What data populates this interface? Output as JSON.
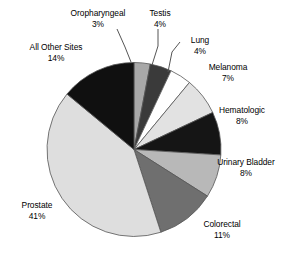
{
  "chart_data": {
    "type": "pie",
    "title": "",
    "subtitle": "",
    "xlabel": "",
    "ylabel": "",
    "legend_position": "none",
    "grid": false,
    "labels_show_percent": true,
    "start_angle_deg": 0,
    "direction": "clockwise",
    "categories": [
      "Oropharyngeal",
      "Testis",
      "Lung",
      "Melanoma",
      "Hematologic",
      "Urinary Bladder",
      "Colorectal",
      "Prostate",
      "All Other Sites"
    ],
    "values": [
      3,
      4,
      4,
      7,
      8,
      8,
      11,
      41,
      14
    ],
    "value_labels": [
      "3%",
      "4%",
      "4%",
      "7%",
      "8%",
      "8%",
      "11%",
      "41%",
      "14%"
    ],
    "colors": [
      "#a8a8a8",
      "#3a3a3a",
      "#ffffff",
      "#e2e2e2",
      "#151515",
      "#b8b8b8",
      "#6f6f6f",
      "#dedede",
      "#101010"
    ],
    "slice_border_color": "#555555",
    "slices": [
      {
        "label": "Oropharyngeal",
        "value": 3,
        "value_label": "3%",
        "color": "#a8a8a8",
        "has_leader_line": true
      },
      {
        "label": "Testis",
        "value": 4,
        "value_label": "4%",
        "color": "#3a3a3a",
        "has_leader_line": true
      },
      {
        "label": "Lung",
        "value": 4,
        "value_label": "4%",
        "color": "#ffffff",
        "has_leader_line": true
      },
      {
        "label": "Melanoma",
        "value": 7,
        "value_label": "7%",
        "color": "#e2e2e2",
        "has_leader_line": false
      },
      {
        "label": "Hematologic",
        "value": 8,
        "value_label": "8%",
        "color": "#151515",
        "has_leader_line": false
      },
      {
        "label": "Urinary Bladder",
        "value": 8,
        "value_label": "8%",
        "color": "#b8b8b8",
        "has_leader_line": false
      },
      {
        "label": "Colorectal",
        "value": 11,
        "value_label": "11%",
        "color": "#6f6f6f",
        "has_leader_line": false
      },
      {
        "label": "Prostate",
        "value": 41,
        "value_label": "41%",
        "color": "#dedede",
        "has_leader_line": false
      },
      {
        "label": "All Other Sites",
        "value": 14,
        "value_label": "14%",
        "color": "#101010",
        "has_leader_line": false
      }
    ]
  }
}
